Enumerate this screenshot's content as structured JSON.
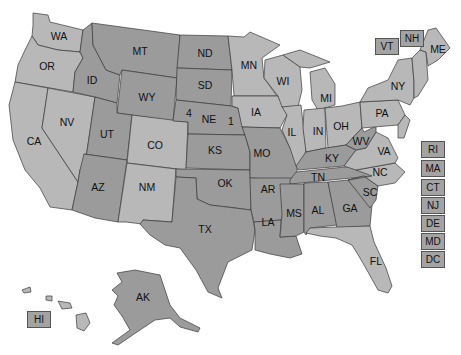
{
  "map": {
    "title": "United States map",
    "colors": {
      "dark": "#9b9b9b",
      "light": "#b8b8b8",
      "border": "#3a3a3a",
      "background": "#ffffff"
    },
    "states": {
      "WA": "WA",
      "OR": "OR",
      "CA": "CA",
      "NV": "NV",
      "ID": "ID",
      "MT": "MT",
      "WY": "WY",
      "UT": "UT",
      "CO": "CO",
      "AZ": "AZ",
      "NM": "NM",
      "ND": "ND",
      "SD": "SD",
      "NE": "NE",
      "KS": "KS",
      "OK": "OK",
      "TX": "TX",
      "MN": "MN",
      "IA": "IA",
      "MO": "MO",
      "AR": "AR",
      "LA": "LA",
      "WI": "WI",
      "IL": "IL",
      "MI": "MI",
      "IN": "IN",
      "OH": "OH",
      "KY": "KY",
      "TN": "TN",
      "MS": "MS",
      "AL": "AL",
      "GA": "GA",
      "FL": "FL",
      "SC": "SC",
      "NC": "NC",
      "VA": "VA",
      "WV": "WV",
      "PA": "PA",
      "NY": "NY",
      "ME": "ME",
      "AK": "AK"
    },
    "nebraska_districts": {
      "left": "4",
      "right": "1"
    },
    "small_state_boxes": [
      "VT",
      "NH",
      "RI",
      "MA",
      "CT",
      "NJ",
      "DE",
      "MD",
      "DC",
      "HI"
    ]
  }
}
